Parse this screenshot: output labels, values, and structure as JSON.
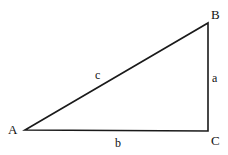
{
  "diagram": {
    "type": "right-triangle",
    "vertices": {
      "A": {
        "label": "A",
        "x": 25,
        "y": 130
      },
      "B": {
        "label": "B",
        "x": 208,
        "y": 23
      },
      "C": {
        "label": "C",
        "x": 208,
        "y": 131
      }
    },
    "sides": {
      "a": {
        "label": "a",
        "between": [
          "B",
          "C"
        ]
      },
      "b": {
        "label": "b",
        "between": [
          "A",
          "C"
        ]
      },
      "c": {
        "label": "c",
        "between": [
          "A",
          "B"
        ]
      }
    },
    "stroke_color": "#1a1a1a"
  }
}
